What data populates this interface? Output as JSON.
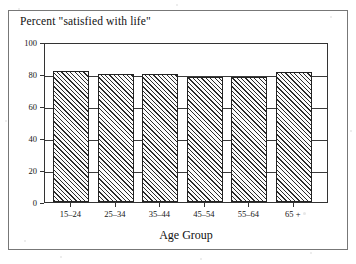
{
  "figure": {
    "title": "Percent \"satisfied with life\"",
    "x_axis_title": "Age Group",
    "frame_color": "#777777",
    "axis_color": "#333333",
    "bar_edge_color": "#222222",
    "bar_hatch": "diagonal-forward-hatch"
  },
  "chart_data": {
    "type": "bar",
    "title": "Percent \"satisfied with life\"",
    "xlabel": "Age Group",
    "ylabel": "",
    "categories": [
      "15–24",
      "25–34",
      "35–44",
      "45–54",
      "55–64",
      "65 +"
    ],
    "values": [
      82,
      80,
      80,
      78,
      78,
      81
    ],
    "ylim": [
      0,
      100
    ],
    "yticks": [
      0,
      20,
      40,
      60,
      80,
      100
    ],
    "ytick_labels": [
      "0",
      "20",
      "40",
      "60",
      "80",
      "100"
    ],
    "grid": true,
    "grid_axis": "y",
    "legend": false
  }
}
